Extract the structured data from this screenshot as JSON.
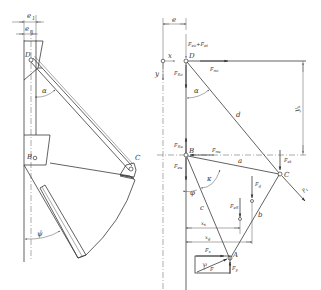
{
  "figure": {
    "left_view": {
      "title": "bucket mechanism sketch",
      "labels": {
        "e1": "e",
        "e1_sub": "1",
        "en": "e",
        "en_sub": "n",
        "D": "D",
        "alpha": "α",
        "B": "B",
        "C": "C",
        "psi": "ψ̄"
      }
    },
    "right_view": {
      "title": "force diagram",
      "labels": {
        "e": "e",
        "x": "x",
        "y": "y",
        "D": "D",
        "Fed_Fet": "F",
        "Fed_sub": "eo",
        "plus": "+",
        "Fet_label": "F",
        "Fet_sub": "et",
        "Fno": "F",
        "Fno_sub": "no",
        "Fso": "F",
        "Fso_sub": "So",
        "alpha": "α",
        "d": "d",
        "yk": "y",
        "yk_sub": "k",
        "Fsu": "F",
        "Fsu_sub": "Su",
        "B": "B",
        "Fnu": "F",
        "Fnu_sub": "nu",
        "a": "a",
        "Fet2": "F",
        "Fet2_sub": "et",
        "C": "C",
        "Feu": "F",
        "Feu_sub": "eu",
        "kappa": "κ",
        "phi": "φ",
        "Fg": "F",
        "Fg_sub": "g",
        "Ft": "F",
        "Ft_sub": "t",
        "Fes": "F",
        "Fes_sub": "eS",
        "c": "c",
        "b": "b",
        "xs": "x",
        "xs_sub": "s",
        "xg": "x",
        "xg_sub": "g",
        "Fx": "F",
        "Fx_sub": "x",
        "A": "A",
        "rho": "ρ",
        "F": "F",
        "Fy": "F",
        "Fy_sub": "y"
      }
    }
  }
}
